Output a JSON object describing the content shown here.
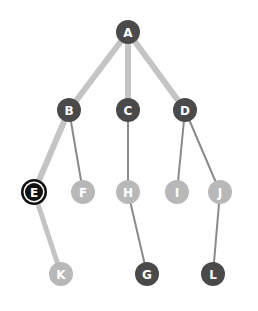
{
  "colors": {
    "dark": "#4a4a4a",
    "light": "#b8b8b8",
    "edge_light": "#c4c4c4",
    "edge_dark": "#8a8a8a",
    "selected_ring": "#111111"
  },
  "nodes": [
    {
      "id": "A",
      "label": "A",
      "x": 128,
      "y": 32,
      "style": "dark"
    },
    {
      "id": "B",
      "label": "B",
      "x": 69,
      "y": 110,
      "style": "dark"
    },
    {
      "id": "C",
      "label": "C",
      "x": 128,
      "y": 110,
      "style": "dark"
    },
    {
      "id": "D",
      "label": "D",
      "x": 185,
      "y": 110,
      "style": "dark"
    },
    {
      "id": "E",
      "label": "E",
      "x": 34,
      "y": 192,
      "style": "selected"
    },
    {
      "id": "F",
      "label": "F",
      "x": 83,
      "y": 192,
      "style": "light"
    },
    {
      "id": "H",
      "label": "H",
      "x": 128,
      "y": 192,
      "style": "light"
    },
    {
      "id": "I",
      "label": "I",
      "x": 177,
      "y": 192,
      "style": "light"
    },
    {
      "id": "J",
      "label": "J",
      "x": 220,
      "y": 192,
      "style": "light"
    },
    {
      "id": "K",
      "label": "K",
      "x": 61,
      "y": 274,
      "style": "light"
    },
    {
      "id": "G",
      "label": "G",
      "x": 147,
      "y": 274,
      "style": "dark"
    },
    {
      "id": "L",
      "label": "L",
      "x": 213,
      "y": 274,
      "style": "dark"
    }
  ],
  "edges": [
    {
      "from": "A",
      "to": "B",
      "width": 6,
      "color": "edge_light"
    },
    {
      "from": "A",
      "to": "C",
      "width": 6,
      "color": "edge_light"
    },
    {
      "from": "A",
      "to": "D",
      "width": 6,
      "color": "edge_light"
    },
    {
      "from": "B",
      "to": "E",
      "width": 6,
      "color": "edge_light"
    },
    {
      "from": "B",
      "to": "F",
      "width": 2,
      "color": "edge_dark"
    },
    {
      "from": "C",
      "to": "H",
      "width": 2,
      "color": "edge_dark"
    },
    {
      "from": "D",
      "to": "I",
      "width": 2,
      "color": "edge_dark"
    },
    {
      "from": "D",
      "to": "J",
      "width": 2,
      "color": "edge_dark"
    },
    {
      "from": "E",
      "to": "K",
      "width": 5,
      "color": "edge_light"
    },
    {
      "from": "H",
      "to": "G",
      "width": 2,
      "color": "edge_dark"
    },
    {
      "from": "J",
      "to": "L",
      "width": 2,
      "color": "edge_dark"
    }
  ]
}
